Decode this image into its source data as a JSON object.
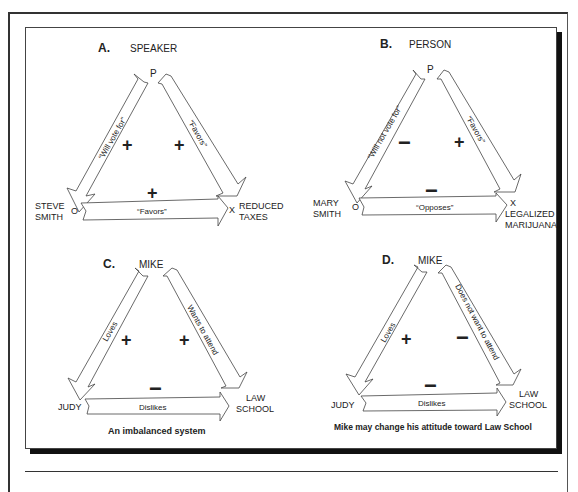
{
  "panels": [
    {
      "letter": "A.",
      "title": "SPEAKER",
      "apex": "P",
      "left_node_mark": "O",
      "left_node_label": [
        "STEVE",
        "SMITH"
      ],
      "right_node_mark": "X",
      "right_node_label": [
        "REDUCED",
        "TAXES"
      ],
      "left_edge": "“Will vote for”",
      "right_edge": "“Favors”",
      "bottom_edge": "“Favors”",
      "signs": {
        "left": "+",
        "right": "+",
        "bottom": "+"
      },
      "caption": ""
    },
    {
      "letter": "B.",
      "title": "PERSON",
      "apex": "P",
      "left_node_mark": "O",
      "left_node_label": [
        "MARY",
        "SMITH"
      ],
      "right_node_mark": "X",
      "right_node_label": [
        "LEGALIZED",
        "MARIJUANA"
      ],
      "left_edge": "“Will not vote for”",
      "right_edge": "“Favors”",
      "bottom_edge": "“Opposes”",
      "signs": {
        "left": "−",
        "right": "+",
        "bottom": "−"
      },
      "caption": ""
    },
    {
      "letter": "C.",
      "title": "MIKE",
      "apex": "",
      "left_node_mark": "",
      "left_node_label": [
        "JUDY"
      ],
      "right_node_mark": "",
      "right_node_label": [
        "LAW",
        "SCHOOL"
      ],
      "left_edge": "Loves",
      "right_edge": "Wants to attend",
      "bottom_edge": "Dislikes",
      "signs": {
        "left": "+",
        "right": "+",
        "bottom": "−"
      },
      "caption": "An imbalanced system"
    },
    {
      "letter": "D.",
      "title": "MIKE",
      "apex": "",
      "left_node_mark": "",
      "left_node_label": [
        "JUDY"
      ],
      "right_node_mark": "",
      "right_node_label": [
        "LAW",
        "SCHOOL"
      ],
      "left_edge": "Loves",
      "right_edge": "Does not want to attend",
      "bottom_edge": "Dislikes",
      "signs": {
        "left": "+",
        "right": "−",
        "bottom": "−"
      },
      "caption": "Mike may change his attitude toward Law School"
    }
  ]
}
